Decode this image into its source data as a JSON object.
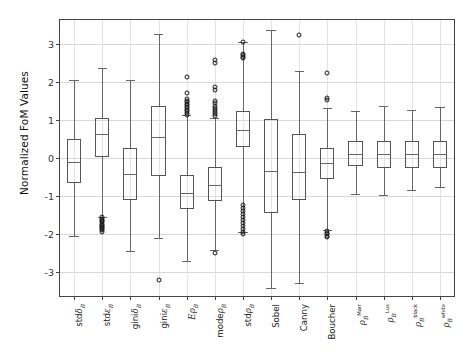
{
  "chart_data": {
    "type": "box",
    "title": "",
    "xlabel": "",
    "ylabel": "Normalized FoM Values",
    "ylim": [
      -3.62,
      3.62
    ],
    "yticks": [
      3,
      2,
      1,
      0,
      -1,
      -2,
      -3
    ],
    "ytick_labels": [
      "3",
      "2",
      "1",
      "0",
      "-1",
      "-2",
      "-3"
    ],
    "grid": true,
    "legend": "none",
    "categories": [
      "stdδ_B",
      "stdε_B",
      "giniδ_B",
      "giniε_B",
      "Eρ_B",
      "modeρ_B",
      "stdρ_B",
      "Sobel",
      "Canny",
      "Boucher",
      "ρ_B^Marr",
      "ρ_B^Lux",
      "ρ_B^black",
      "ρ_B^white"
    ],
    "boxes": [
      {
        "name": "stdδ_B",
        "whislo": -2.05,
        "q1": -0.65,
        "med": -0.1,
        "q3": 0.5,
        "whishi": 2.05,
        "fliers": []
      },
      {
        "name": "stdε_B",
        "whislo": -1.55,
        "q1": 0.02,
        "med": 0.62,
        "q3": 1.06,
        "whishi": 2.35,
        "fliers": [
          -1.56,
          -1.6,
          -1.63,
          -1.66,
          -1.69,
          -1.72,
          -1.75,
          -1.78,
          -1.81,
          -1.84,
          -1.87,
          -1.9,
          -1.93
        ]
      },
      {
        "name": "giniδ_B",
        "whislo": -2.45,
        "q1": -1.1,
        "med": -0.43,
        "q3": 0.25,
        "whishi": 2.05,
        "fliers": []
      },
      {
        "name": "giniε_B",
        "whislo": -2.1,
        "q1": -0.46,
        "med": 0.55,
        "q3": 1.36,
        "whishi": 3.25,
        "fliers": [
          -3.2
        ]
      },
      {
        "name": "Eρ_B",
        "whislo": -2.7,
        "q1": -1.33,
        "med": -0.91,
        "q3": -0.44,
        "whishi": 1.12,
        "fliers": [
          2.12,
          1.7,
          1.55,
          1.5,
          1.46,
          1.42,
          1.38,
          1.34,
          1.3,
          1.26,
          1.22,
          1.18,
          1.14
        ]
      },
      {
        "name": "modeρ_B",
        "whislo": -2.42,
        "q1": -1.13,
        "med": -0.72,
        "q3": -0.24,
        "whishi": 1.05,
        "fliers": [
          2.56,
          2.48,
          1.86,
          1.79,
          1.49,
          1.43,
          1.36,
          1.3,
          1.25,
          1.2,
          1.15,
          1.1,
          -2.5
        ]
      },
      {
        "name": "stdρ_B",
        "whislo": -1.95,
        "q1": 0.28,
        "med": 0.73,
        "q3": 1.22,
        "whishi": 3.05,
        "fliers": [
          3.03,
          2.73,
          2.7,
          2.66,
          2.62,
          -1.22,
          -1.3,
          -1.38,
          -1.46,
          -1.54,
          -1.62,
          -1.7,
          -1.78,
          -1.86,
          -1.94,
          -2.0
        ]
      },
      {
        "name": "Sobel",
        "whislo": -3.4,
        "q1": -1.45,
        "med": -0.35,
        "q3": 1.02,
        "whishi": 3.35,
        "fliers": []
      },
      {
        "name": "Canny",
        "whislo": -3.28,
        "q1": -1.1,
        "med": -0.38,
        "q3": 0.62,
        "whishi": 2.28,
        "fliers": [
          3.22
        ]
      },
      {
        "name": "Boucher",
        "whislo": -1.9,
        "q1": -0.55,
        "med": -0.14,
        "q3": 0.25,
        "whishi": 1.3,
        "fliers": [
          2.22,
          1.58,
          1.52,
          -1.92,
          -1.96,
          -2.0,
          -2.04,
          -2.08
        ]
      },
      {
        "name": "ρ_B^Marr",
        "whislo": -0.95,
        "q1": -0.22,
        "med": 0.11,
        "q3": 0.44,
        "whishi": 1.22,
        "fliers": []
      },
      {
        "name": "ρ_B^Lux",
        "whislo": -0.98,
        "q1": -0.26,
        "med": 0.11,
        "q3": 0.45,
        "whishi": 1.37,
        "fliers": []
      },
      {
        "name": "ρ_B^black",
        "whislo": -0.84,
        "q1": -0.26,
        "med": 0.11,
        "q3": 0.45,
        "whishi": 1.25,
        "fliers": []
      },
      {
        "name": "ρ_B^white",
        "whislo": -0.77,
        "q1": -0.27,
        "med": 0.1,
        "q3": 0.45,
        "whishi": 1.35,
        "fliers": []
      }
    ],
    "colors": {
      "box_edge": "#555555",
      "median": "#666666",
      "whisker": "#666666",
      "flier_edge": "#1a1a1a",
      "grid": "#d9d9d9",
      "axis": "#444444",
      "background": "#ffffff"
    }
  },
  "axis": {
    "ylabel_text": "Normalized FoM Values"
  },
  "xlabels_html": [
    "<span class='rm'>std</span><span class='it'>&#948;</span><sub>B</sub>",
    "<span class='rm'>std</span><span class='it'>&#949;</span><sub>B</sub>",
    "<span class='rm'>gini</span><span class='it'>&#948;</span><sub>B</sub>",
    "<span class='rm'>gini</span><span class='it'>&#949;</span><sub>B</sub>",
    "<span class='it'>E</span><span class='it'>&#961;</span><sub>B</sub>",
    "<span class='rm'>mode</span><span class='it'>&#961;</span><sub>B</sub>",
    "<span class='rm'>std</span><span class='it'>&#961;</span><sub>B</sub>",
    "<span class='rm'>Sobel</span>",
    "<span class='rm'>Canny</span>",
    "<span class='rm'>Boucher</span>",
    "<span class='it'>&#961;</span><sub>B</sub><sup>Marr</sup>",
    "<span class='it'>&#961;</span><sub>B</sub><sup>Lux</sup>",
    "<span class='it'>&#961;</span><sub>B</sub><sup>black</sup>",
    "<span class='it'>&#961;</span><sub>B</sub><sup>white</sup>"
  ]
}
